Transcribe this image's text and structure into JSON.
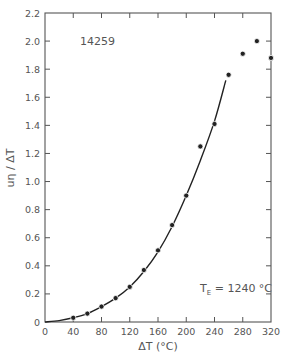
{
  "chart_data": {
    "type": "scatter",
    "title": "",
    "sample_label": "14259",
    "annotation": {
      "main": "T",
      "subscript": "E",
      "rest": " = 1240 °C"
    },
    "xlabel": "ΔT (°C)",
    "ylabel": "uη / ΔT",
    "xlim": [
      0,
      320
    ],
    "ylim": [
      0,
      2.2
    ],
    "x_ticks": [
      0,
      40,
      80,
      120,
      160,
      200,
      240,
      280,
      320
    ],
    "x_tick_labels": [
      "0",
      "40",
      "80",
      "120",
      "160",
      "200",
      "240",
      "280",
      "320"
    ],
    "y_ticks": [
      0,
      0.2,
      0.4,
      0.6,
      0.8,
      1.0,
      1.2,
      1.4,
      1.6,
      1.8,
      2.0,
      2.2
    ],
    "y_tick_labels": [
      "0",
      "0.2",
      "0.4",
      "0.6",
      "0.8",
      "1.0",
      "1.2",
      "1.4",
      "1.6",
      "1.8",
      "2.0",
      "2.2"
    ],
    "grid": false,
    "series": [
      {
        "name": "data points",
        "marker": "filled-circle",
        "x": [
          40,
          60,
          80,
          100,
          120,
          140,
          160,
          180,
          200,
          220,
          240,
          260,
          280,
          300,
          320
        ],
        "y": [
          0.03,
          0.06,
          0.11,
          0.17,
          0.25,
          0.37,
          0.51,
          0.69,
          0.9,
          1.25,
          1.41,
          1.76,
          1.91,
          2.0,
          1.88
        ]
      },
      {
        "name": "fitted curve",
        "style": "solid-line",
        "x": [
          0,
          20,
          40,
          60,
          80,
          100,
          120,
          140,
          160,
          180,
          200,
          220,
          240,
          256
        ],
        "y": [
          0,
          0.01,
          0.03,
          0.06,
          0.11,
          0.17,
          0.25,
          0.36,
          0.5,
          0.68,
          0.9,
          1.15,
          1.43,
          1.72
        ]
      }
    ],
    "colors": {
      "axis": "#555555",
      "data": "#222222",
      "text": "#555555"
    }
  }
}
